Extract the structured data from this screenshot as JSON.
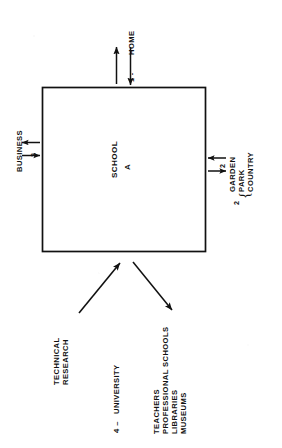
{
  "diagram": {
    "center_box": {
      "line1": "SCHOOL",
      "line2": "A"
    },
    "flows": [
      {
        "id": "home",
        "number": "1 -",
        "label": "HOME",
        "side": "top",
        "arrows": "bidirectional"
      },
      {
        "id": "business",
        "number": "3",
        "label": "BUSINESS",
        "side": "left",
        "arrows": "bidirectional"
      },
      {
        "id": "recreation",
        "number": "2",
        "number_outer": "2",
        "label_lines": [
          "GARDEN",
          "PARK",
          "COUNTRY"
        ],
        "brace": "{",
        "side": "right",
        "arrows": "bidirectional"
      },
      {
        "id": "university",
        "number": "4 –",
        "label": "UNIVERSITY",
        "side": "bottom",
        "arrows": "bidirectional-diagonal"
      }
    ],
    "bottom_left_label": {
      "lines": [
        "TECHNICAL",
        "RESEARCH"
      ]
    },
    "bottom_right_label": {
      "lines": [
        "TEACHERS",
        "PROFESSIONAL SCHOOLS",
        "LIBRARIES",
        "MUSEUMS"
      ]
    },
    "colors": {
      "ink": "#111111",
      "paper": "#ffffff"
    }
  }
}
